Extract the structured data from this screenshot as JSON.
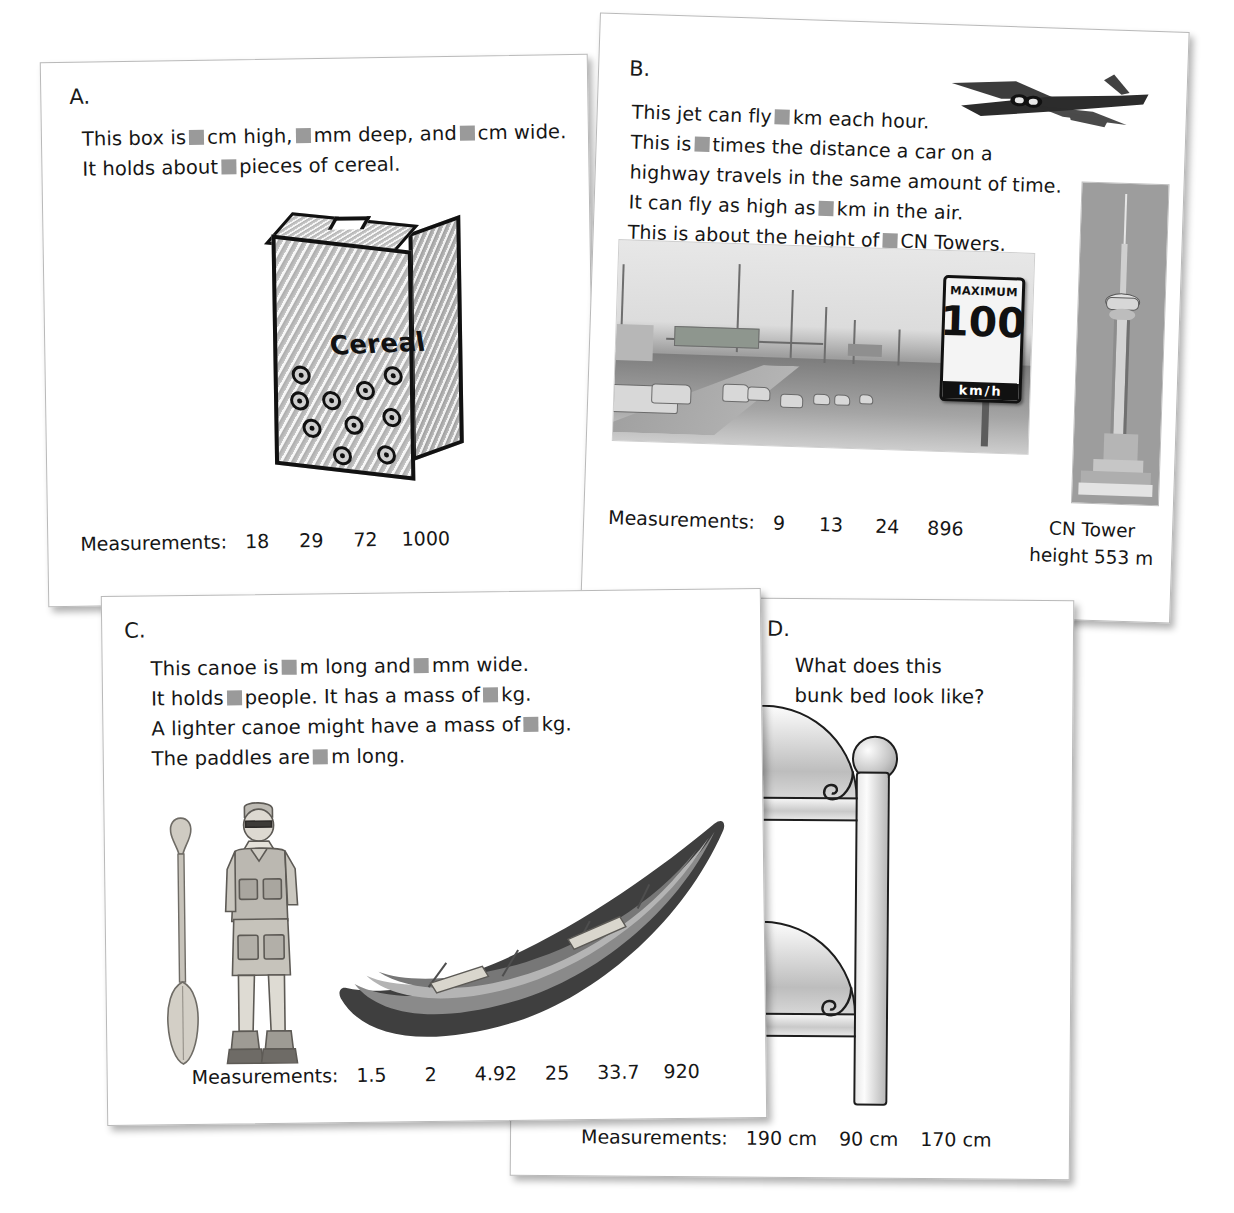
{
  "page": {
    "blank_label": "answer-blank",
    "measurements_label": "Measurements:"
  },
  "cards": [
    {
      "id": "A",
      "letter": "A.",
      "lines": [
        {
          "parts": [
            "This box is ",
            "BLANK",
            " cm high, ",
            "BLANK",
            " mm deep, and ",
            "BLANK",
            " cm wide."
          ]
        },
        {
          "parts": [
            "It holds about ",
            "BLANK",
            " pieces of cereal."
          ]
        }
      ],
      "text_line_1_prefix": "This box is",
      "text_line_1_a": "cm high,",
      "text_line_1_b": "mm deep, and",
      "text_line_1_c": "cm wide.",
      "text_line_2_prefix": "It holds about",
      "text_line_2_a": "pieces of cereal.",
      "measurements_label": "Measurements:",
      "measurements": [
        "18",
        "29",
        "72",
        "1000"
      ],
      "illustration": {
        "name": "cereal-box",
        "box_label": "Cereal",
        "cereal_pieces": 10
      }
    },
    {
      "id": "B",
      "letter": "B.",
      "text_line_1_prefix": "This jet can fly",
      "text_line_1_a": "km each hour.",
      "text_line_2_prefix": "This is",
      "text_line_2_a": "times the distance a car on a",
      "text_line_3": "highway travels in the same amount of time.",
      "text_line_4_prefix": "It can fly as high as",
      "text_line_4_a": "km in the air.",
      "text_line_5_prefix": "This is about the height of",
      "text_line_5_a": "CN Towers.",
      "measurements_label": "Measurements:",
      "measurements": [
        "9",
        "13",
        "24",
        "896"
      ],
      "caption_line_1": "CN Tower",
      "caption_line_2": "height 553 m",
      "photos": [
        {
          "name": "jet-photo",
          "alt": "jet airliner in flight"
        },
        {
          "name": "highway-photo",
          "alt": "highway traffic with speed limit sign"
        },
        {
          "name": "cn-tower-photo",
          "alt": "CN Tower"
        }
      ],
      "speed_sign": {
        "top_word": "MAXIMUM",
        "number": "100",
        "unit": "km/h"
      }
    },
    {
      "id": "C",
      "letter": "C.",
      "text_line_1_prefix": "This canoe is",
      "text_line_1_a": "m long and",
      "text_line_1_b": "mm wide.",
      "text_line_2_prefix": "It holds",
      "text_line_2_a": "people. It has a mass of",
      "text_line_2_b": "kg.",
      "text_line_3_prefix": "A lighter canoe might have a mass of",
      "text_line_3_a": "kg.",
      "text_line_4_prefix": "The paddles are",
      "text_line_4_a": "m long.",
      "measurements_label": "Measurements:",
      "measurements": [
        "1.5",
        "2",
        "4.92",
        "25",
        "33.7",
        "920"
      ],
      "illustration": {
        "name": "canoe-and-paddler",
        "alt": "person holding a paddle beside a canoe"
      }
    },
    {
      "id": "D",
      "letter": "D.",
      "question_line_1": "What does this",
      "question_line_2": "bunk bed look like?",
      "measurements_label": "Measurements:",
      "measurements": [
        "190 cm",
        "90 cm",
        "170 cm"
      ],
      "illustration": {
        "name": "bunk-bed",
        "alt": "bunk bed end with two arched headboards"
      }
    }
  ],
  "colors": {
    "paper": "#ffffff",
    "ink": "#161616",
    "blank_square": "#9a9a9a",
    "card_border": "#b9b9b9",
    "photo_gray": "#9d9d9d"
  }
}
